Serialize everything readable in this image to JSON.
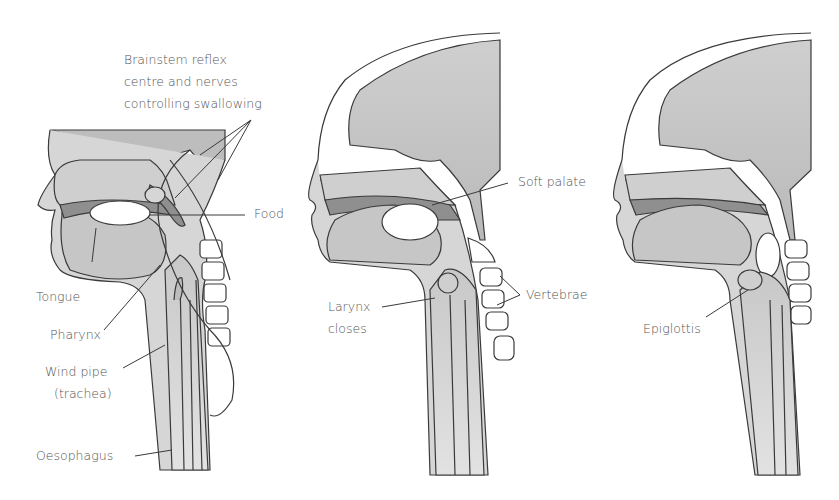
{
  "diagram": {
    "colors": {
      "tissue_light": "#d6d6d6",
      "tissue_mid": "#bdbdbd",
      "tissue_dark": "#8f8f8f",
      "outline": "#3a3a3a",
      "label_text": "#555555"
    },
    "panels": [
      {
        "id": "panel-1",
        "labels": {
          "brainstem_line1": "Brainstem reflex",
          "brainstem_line2": "centre and nerves",
          "brainstem_line3": "controlling swallowing",
          "food": "Food",
          "tongue": "Tongue",
          "pharynx": "Pharynx",
          "windpipe_line1": "Wind pipe",
          "windpipe_line2": "(trachea)",
          "oesophagus": "Oesophagus"
        }
      },
      {
        "id": "panel-2",
        "labels": {
          "soft_palate": "Soft palate",
          "larynx_line1": "Larynx",
          "larynx_line2": "closes",
          "vertebrae": "Vertebrae"
        }
      },
      {
        "id": "panel-3",
        "labels": {
          "epiglottis": "Epiglottis"
        }
      }
    ]
  }
}
